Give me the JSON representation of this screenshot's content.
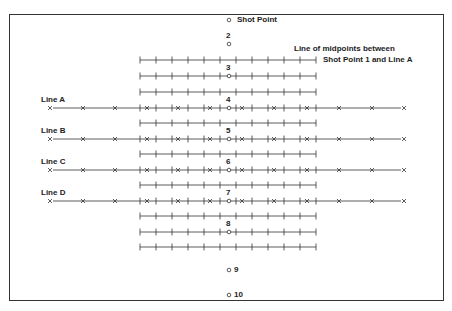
{
  "diagram": {
    "shot_point_label": "Shot Point",
    "midpoint_note_line1": "Line of midpoints between",
    "midpoint_note_line2": "Shot Point 1 and Line A",
    "receiver_lines": [
      {
        "label": "Line A",
        "y": 108
      },
      {
        "label": "Line B",
        "y": 139
      },
      {
        "label": "Line C",
        "y": 170
      },
      {
        "label": "Line D",
        "y": 201
      }
    ],
    "shot_points": [
      {
        "num": "",
        "y": 20
      },
      {
        "num": "2",
        "y": 44
      },
      {
        "num": "3",
        "y": 76
      },
      {
        "num": "4",
        "y": 108
      },
      {
        "num": "5",
        "y": 139
      },
      {
        "num": "6",
        "y": 170
      },
      {
        "num": "7",
        "y": 201
      },
      {
        "num": "8",
        "y": 232
      },
      {
        "num": "9",
        "y": 270
      },
      {
        "num": "10",
        "y": 295
      }
    ],
    "midpoint_line_ys": [
      60,
      76,
      92,
      123,
      154,
      185,
      216,
      232,
      247
    ],
    "colors": {
      "line": "#333333",
      "text": "#222222"
    }
  }
}
